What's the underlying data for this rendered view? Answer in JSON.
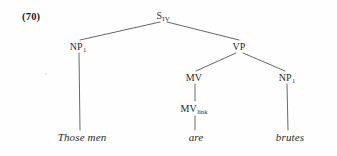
{
  "figure": {
    "example_number": "(70)",
    "sentence": "Those men are brutes",
    "ink_color": "#2a2a2a",
    "line_color": "#4a4a4a",
    "background_color": "#fefefe"
  },
  "nodes": {
    "root": {
      "label": "S",
      "subscript": "IV",
      "x": 163,
      "y": 17
    },
    "np_subject": {
      "label": "NP",
      "subscript": "1",
      "x": 78,
      "y": 48
    },
    "vp": {
      "label": "VP",
      "subscript": "",
      "x": 239,
      "y": 48
    },
    "mv": {
      "label": "MV",
      "subscript": "",
      "x": 194,
      "y": 79
    },
    "np_object": {
      "label": "NP",
      "subscript": "1",
      "x": 287,
      "y": 79
    },
    "mv_link": {
      "label": "MV",
      "subscript": "link",
      "x": 194,
      "y": 110
    }
  },
  "terminals": {
    "subject": {
      "text": "Those men",
      "x": 82,
      "y": 139
    },
    "verb": {
      "text": "are",
      "x": 196,
      "y": 139
    },
    "object": {
      "text": "brutes",
      "x": 290,
      "y": 139
    }
  },
  "edges": [
    {
      "name": "s-to-np-subject",
      "x1": 160,
      "y1": 22,
      "x2": 80,
      "y2": 40
    },
    {
      "name": "s-to-vp",
      "x1": 167,
      "y1": 22,
      "x2": 239,
      "y2": 40
    },
    {
      "name": "vp-to-mv",
      "x1": 236,
      "y1": 53,
      "x2": 196,
      "y2": 71
    },
    {
      "name": "vp-to-np-object",
      "x1": 243,
      "y1": 53,
      "x2": 285,
      "y2": 71
    },
    {
      "name": "mv-to-mv-link",
      "x1": 195,
      "y1": 84,
      "x2": 195,
      "y2": 101
    },
    {
      "name": "np-subject-to-those-men",
      "x1": 79,
      "y1": 53,
      "x2": 80,
      "y2": 130
    },
    {
      "name": "mv-link-to-are",
      "x1": 195,
      "y1": 116,
      "x2": 195,
      "y2": 130
    },
    {
      "name": "np-object-to-brutes",
      "x1": 287,
      "y1": 84,
      "x2": 288,
      "y2": 130
    }
  ]
}
